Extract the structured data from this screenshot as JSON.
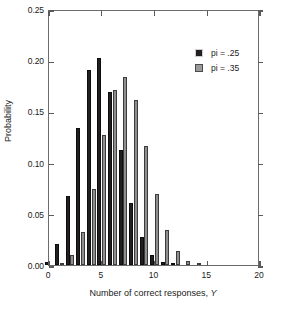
{
  "chart_data": {
    "type": "bar",
    "title": "",
    "xlabel": "Number of correct responses, Y",
    "xlabel_plain": "Number of correct responses, ",
    "xlabel_italic": "Y",
    "ylabel": "Probability",
    "xlim": [
      0,
      20
    ],
    "ylim": [
      0,
      0.25
    ],
    "xticks": [
      0,
      5,
      10,
      15,
      20
    ],
    "xtick_labels": [
      "0",
      "5",
      "10",
      "15",
      "20"
    ],
    "yticks": [
      0.0,
      0.05,
      0.1,
      0.15,
      0.2,
      0.25
    ],
    "ytick_labels": [
      "0.00",
      "0.05",
      "0.10",
      "0.15",
      "0.20",
      "0.25"
    ],
    "grid": false,
    "legend_position": "upper-right",
    "categories": [
      0,
      1,
      2,
      3,
      4,
      5,
      6,
      7,
      8,
      9,
      10,
      11,
      12,
      13,
      14,
      15,
      16,
      17,
      18,
      19,
      20
    ],
    "series": [
      {
        "name": "pi = .25",
        "color": "#231f20",
        "values": [
          0.003,
          0.021,
          0.067,
          0.134,
          0.19,
          0.202,
          0.169,
          0.112,
          0.061,
          0.027,
          0.01,
          0.003,
          0.001,
          0.0,
          0.0,
          0.0,
          0.0,
          0.0,
          0.0,
          0.0,
          0.0
        ]
      },
      {
        "name": "pi = .35",
        "color": "#8f8f8f",
        "values": [
          0.0,
          0.002,
          0.01,
          0.032,
          0.074,
          0.127,
          0.171,
          0.184,
          0.161,
          0.116,
          0.069,
          0.034,
          0.014,
          0.004,
          0.001,
          0.0,
          0.0,
          0.0,
          0.0,
          0.0,
          0.0
        ]
      }
    ]
  },
  "legend": {
    "items": [
      {
        "label": "pi = .25",
        "swatch": "black-square-swatch"
      },
      {
        "label": "pi = .35",
        "swatch": "gray-square-swatch"
      }
    ]
  }
}
